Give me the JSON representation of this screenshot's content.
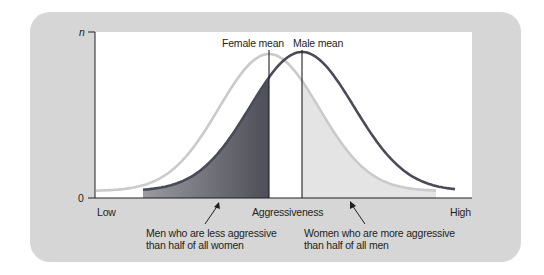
{
  "chart_data": {
    "type": "area",
    "title": "",
    "xlabel": "Aggressiveness",
    "ylabel": "n",
    "x_tick_labels": {
      "left": "Low",
      "right": "High"
    },
    "y_tick_labels": {
      "top": "n",
      "bottom": "0"
    },
    "series": [
      {
        "name": "Female",
        "color": "#c8c8c8",
        "mean_label": "Female mean",
        "mean_position": 0.47,
        "peak_relative_height": 0.98
      },
      {
        "name": "Male",
        "color": "#4a4a58",
        "mean_label": "Male mean",
        "mean_position": 0.55,
        "peak_relative_height": 1.0
      }
    ],
    "shaded_regions": [
      {
        "name": "men-less-aggressive",
        "under": "Male",
        "from": "Low",
        "to": "Female mean",
        "color": "#6e6e76"
      },
      {
        "name": "women-more-aggressive",
        "under": "Female",
        "from": "Male mean",
        "to": "High",
        "color": "#e8e8e8"
      }
    ],
    "annotations": [
      {
        "text_line1": "Men who are less aggressive",
        "text_line2": "than half of all women"
      },
      {
        "text_line1": "Women who are more aggressive",
        "text_line2": "than half of all men"
      }
    ],
    "grid": false,
    "legend": "none"
  },
  "colors": {
    "panel": "#d6d6d6",
    "plot": "#ffffff",
    "axis": "#231f20",
    "female_curve": "#c8c8c8",
    "male_curve": "#4a4a58",
    "male_shade_dark": "#5e5e66",
    "male_shade_light": "#9c9ca2",
    "female_shade": "#e6e6e6"
  }
}
